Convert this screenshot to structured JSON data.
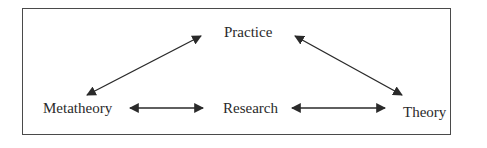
{
  "diagram": {
    "nodes": {
      "practice": "Practice",
      "metatheory": "Metatheory",
      "research": "Research",
      "theory": "Theory"
    },
    "edges": [
      {
        "from": "Practice",
        "to": "Metatheory",
        "type": "bidirectional"
      },
      {
        "from": "Practice",
        "to": "Theory",
        "type": "bidirectional"
      },
      {
        "from": "Metatheory",
        "to": "Research",
        "type": "bidirectional"
      },
      {
        "from": "Research",
        "to": "Theory",
        "type": "bidirectional"
      }
    ],
    "colors": {
      "line": "#2a2a2a",
      "frame": "#4a4a4a",
      "background": "#ffffff"
    }
  }
}
